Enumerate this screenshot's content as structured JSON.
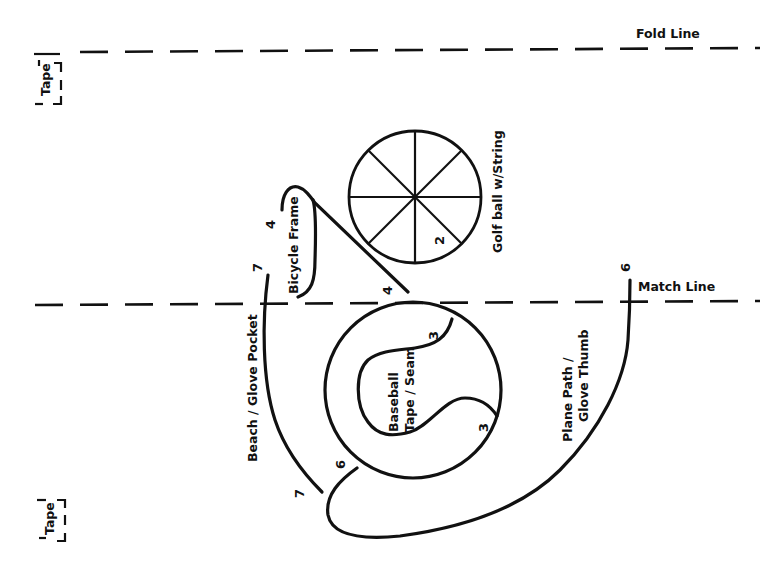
{
  "diagram": {
    "fold_line": {
      "label": "Fold Line"
    },
    "match_line": {
      "label": "Match Line"
    },
    "tape_top": {
      "label": "Tape"
    },
    "tape_bottom": {
      "label": "Tape"
    },
    "shapes": {
      "bicycle_frame": {
        "label": "Bicycle Frame",
        "step_top": "4",
        "step_bottom": "4"
      },
      "golf_ball": {
        "label": "Golf ball w/String",
        "step": "2"
      },
      "baseball": {
        "label_line1": "Baseball",
        "label_line2": "Tape / Seam",
        "step_top": "3",
        "step_bottom": "3"
      },
      "beach_glove_pocket": {
        "label": "Beach / Glove Pocket",
        "step_top": "7",
        "step_bottom": "7"
      },
      "plane_path": {
        "label_line1": "Plane Path /",
        "label_line2": "Glove Thumb",
        "step_top": "6",
        "step_bottom": "6"
      }
    }
  }
}
